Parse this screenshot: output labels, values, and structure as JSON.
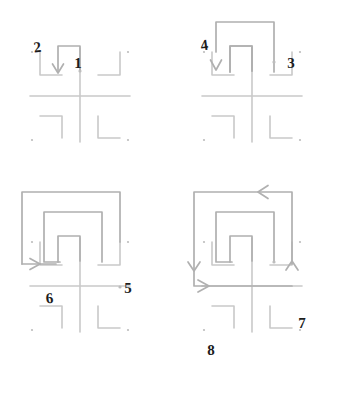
{
  "figure": {
    "canvas": {
      "width": 343,
      "height": 413,
      "background": "#ffffff"
    },
    "colors": {
      "base_stroke": "#c9c9c9",
      "spiral_stroke": "#b0b0b0",
      "dot_fill": "#bdbdbd",
      "label_text": "#1c1c1c",
      "background": "#ffffff"
    },
    "panels": [
      {
        "id": "panel-1",
        "index": 1,
        "origin_x": 0,
        "origin_y": 0,
        "labels": [
          {
            "text": "1",
            "x": 74,
            "y": 62,
            "name": "label-1"
          },
          {
            "text": "2",
            "x": 40,
            "y": 47,
            "name": "label-2"
          }
        ],
        "arrows": [
          {
            "name": "arrow-down-2",
            "direction": "down",
            "x": 55,
            "y": 66
          }
        ],
        "endpoint_dots": [
          {
            "name": "endpoint-dot-1",
            "x": 68,
            "y": 71
          }
        ]
      },
      {
        "id": "panel-2",
        "index": 2,
        "origin_x": 172,
        "origin_y": 0,
        "labels": [
          {
            "text": "3",
            "x": 288,
            "y": 63,
            "name": "label-3"
          },
          {
            "text": "4",
            "x": 206,
            "y": 45,
            "name": "label-4"
          }
        ],
        "arrows": [
          {
            "name": "arrow-down-4",
            "direction": "down",
            "x": 217,
            "y": 68
          }
        ],
        "endpoint_dots": [
          {
            "name": "endpoint-dot-3",
            "x": 281,
            "y": 61
          }
        ]
      },
      {
        "id": "panel-3",
        "index": 3,
        "origin_x": 0,
        "origin_y": 190,
        "labels": [
          {
            "text": "5",
            "x": 125,
            "y": 287,
            "name": "label-5"
          },
          {
            "text": "6",
            "x": 47,
            "y": 298,
            "name": "label-6"
          }
        ],
        "arrows": [
          {
            "name": "arrow-right-6",
            "direction": "right",
            "x": 38,
            "y": 308
          }
        ],
        "endpoint_dots": [
          {
            "name": "endpoint-dot-5",
            "x": 117,
            "y": 287
          }
        ]
      },
      {
        "id": "panel-4",
        "index": 4,
        "origin_x": 172,
        "origin_y": 190,
        "labels": [
          {
            "text": "7",
            "x": 299,
            "y": 322,
            "name": "label-7"
          },
          {
            "text": "8",
            "x": 208,
            "y": 349,
            "name": "label-8"
          }
        ],
        "arrows": [
          {
            "name": "arrow-left-top",
            "direction": "left",
            "x": 259,
            "y": 205
          },
          {
            "name": "arrow-down-left",
            "direction": "down",
            "x": 180,
            "y": 268
          },
          {
            "name": "arrow-up-right",
            "direction": "up",
            "x": 317,
            "y": 263
          },
          {
            "name": "arrow-right-8",
            "direction": "right",
            "x": 199,
            "y": 331
          }
        ],
        "endpoint_dots": [
          {
            "name": "endpoint-dot-7",
            "x": 297,
            "y": 310
          }
        ]
      }
    ],
    "base_pattern": {
      "name": "cross-and-brackets",
      "elements": [
        "horizontal-cross-line",
        "vertical-cross-line",
        "bracket-top-left",
        "bracket-top-right",
        "bracket-bottom-left",
        "bracket-bottom-right",
        "corner-dot-top-left",
        "corner-dot-top-right",
        "corner-dot-bottom-left",
        "corner-dot-bottom-right"
      ]
    }
  }
}
